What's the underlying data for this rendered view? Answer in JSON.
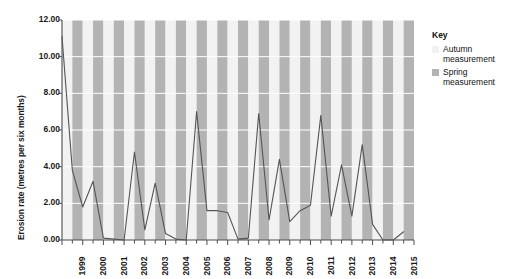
{
  "chart_data": {
    "type": "line",
    "title": "",
    "xlabel": "",
    "ylabel": "Erosion rate (metres per six months)",
    "ylim": [
      0,
      12
    ],
    "ytick_labels": [
      "12.00",
      "10.00",
      "8.00",
      "6.00",
      "4.00",
      "2.00",
      "0.00"
    ],
    "ytick_values": [
      12,
      10,
      8,
      6,
      4,
      2,
      0
    ],
    "xtick_labels": [
      "1999",
      "2000",
      "2001",
      "2002",
      "2003",
      "2004",
      "2005",
      "2006",
      "2007",
      "2008",
      "2009",
      "2010",
      "2011",
      "2012",
      "2013",
      "2014",
      "2015"
    ],
    "x": [
      1999,
      1999.5,
      2000,
      2000.5,
      2001,
      2001.5,
      2002,
      2002.5,
      2003,
      2003.5,
      2004,
      2004.5,
      2005,
      2005.5,
      2006,
      2006.5,
      2007,
      2007.5,
      2008,
      2008.5,
      2009,
      2009.5,
      2010,
      2010.5,
      2011,
      2011.5,
      2012,
      2012.5,
      2013,
      2013.5,
      2014,
      2014.5,
      2015,
      2015.5
    ],
    "values": [
      11.1,
      3.8,
      1.8,
      3.2,
      0.1,
      0.05,
      0.0,
      4.8,
      0.55,
      3.1,
      0.35,
      0.05,
      0.0,
      7.0,
      1.6,
      1.6,
      1.5,
      0.05,
      0.1,
      6.9,
      1.1,
      4.4,
      1.0,
      1.6,
      1.9,
      6.8,
      1.3,
      4.1,
      1.3,
      5.2,
      0.85,
      0.0,
      0.0,
      0.45
    ],
    "grid": true,
    "legend_position": "right",
    "line_color": "#555555",
    "band_light_color": "#f2f2f2",
    "band_dark_color": "#b3b3b3",
    "gridline_color": "#ffffff",
    "axis_color": "#4d4d4d"
  },
  "legend": {
    "title": "Key",
    "items": [
      {
        "label": "Autumn measurement",
        "color": "#f2f2f2"
      },
      {
        "label": "Spring measurement",
        "color": "#b3b3b3"
      }
    ]
  }
}
